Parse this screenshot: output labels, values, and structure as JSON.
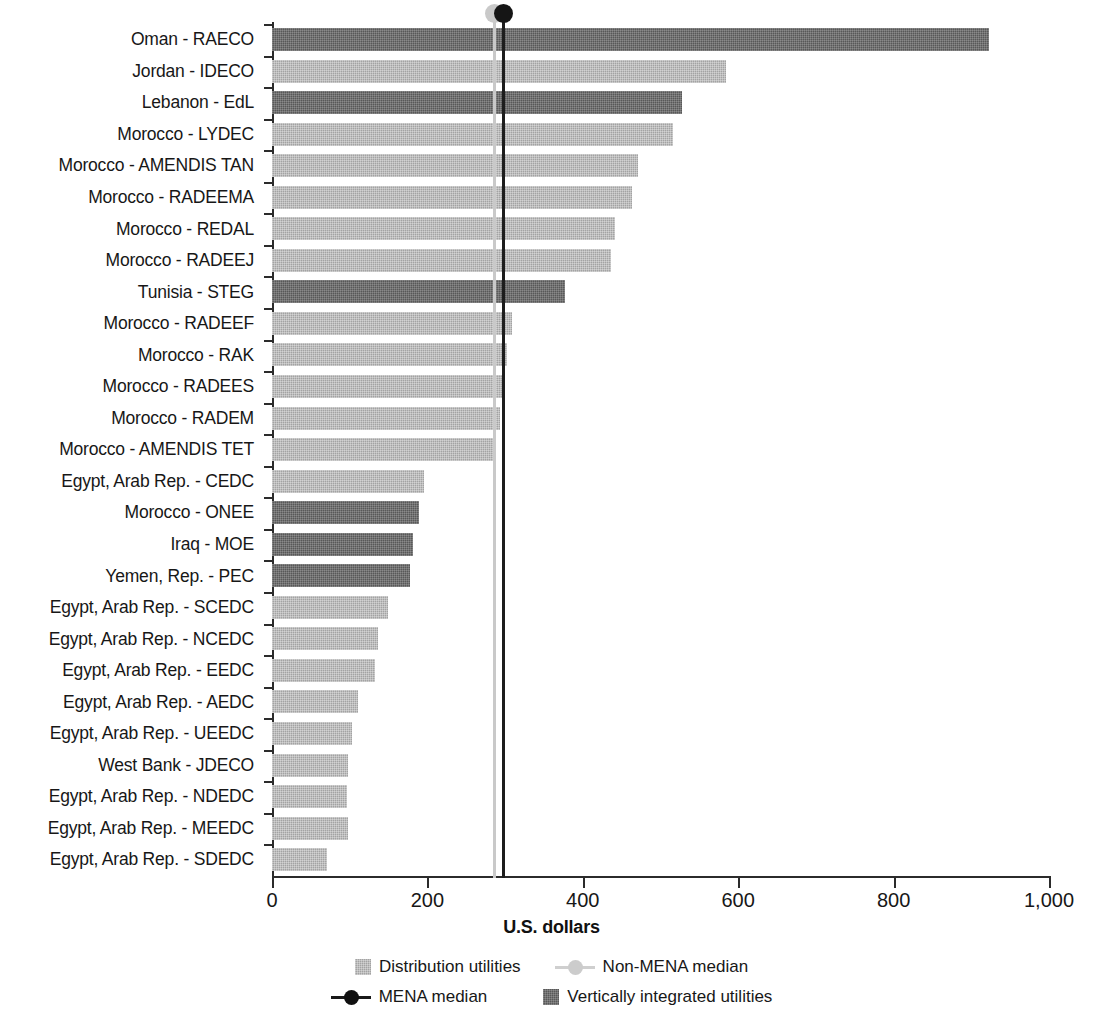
{
  "chart_data": {
    "type": "bar",
    "orientation": "horizontal",
    "title": "",
    "xlabel": "U.S. dollars",
    "ylabel": "",
    "xlim": [
      0,
      1000
    ],
    "xticks": [
      0,
      200,
      400,
      600,
      800,
      1000
    ],
    "xtick_labels": [
      "0",
      "200",
      "400",
      "600",
      "800",
      "1,000"
    ],
    "grid": false,
    "legend_position": "bottom",
    "categories": [
      "Oman - RAECO",
      "Jordan - IDECO",
      "Lebanon - EdL",
      "Morocco - LYDEC",
      "Morocco - AMENDIS TAN",
      "Morocco - RADEEMA",
      "Morocco - REDAL",
      "Morocco - RADEEJ",
      "Tunisia - STEG",
      "Morocco - RADEEF",
      "Morocco - RAK",
      "Morocco - RADEES",
      "Morocco - RADEM",
      "Morocco - AMENDIS TET",
      "Egypt, Arab Rep. - CEDC",
      "Morocco - ONEE",
      "Iraq - MOE",
      "Yemen, Rep. - PEC",
      "Egypt, Arab Rep. - SCEDC",
      "Egypt, Arab Rep. - NCEDC",
      "Egypt, Arab Rep. - EEDC",
      "Egypt, Arab Rep. - AEDC",
      "Egypt, Arab Rep. - UEEDC",
      "West Bank - JDECO",
      "Egypt, Arab Rep. - NDEDC",
      "Egypt, Arab Rep. - MEEDC",
      "Egypt, Arab Rep. - SDEDC"
    ],
    "values": [
      923,
      584,
      528,
      516,
      471,
      463,
      441,
      436,
      377,
      309,
      302,
      299,
      293,
      284,
      196,
      189,
      182,
      178,
      149,
      136,
      132,
      111,
      103,
      98,
      97,
      98,
      71
    ],
    "bar_types": [
      "vertically_integrated",
      "distribution",
      "vertically_integrated",
      "distribution",
      "distribution",
      "distribution",
      "distribution",
      "distribution",
      "vertically_integrated",
      "distribution",
      "distribution",
      "distribution",
      "distribution",
      "distribution",
      "distribution",
      "vertically_integrated",
      "vertically_integrated",
      "vertically_integrated",
      "distribution",
      "distribution",
      "distribution",
      "distribution",
      "distribution",
      "distribution",
      "distribution",
      "distribution",
      "distribution"
    ],
    "reference_lines": [
      {
        "name": "Non-MENA median",
        "value": 284,
        "style": "light"
      },
      {
        "name": "MENA median",
        "value": 296,
        "style": "dark"
      }
    ],
    "series": [
      {
        "name": "Distribution utilities",
        "color": "#a3a3a3"
      },
      {
        "name": "Vertically integrated utilities",
        "color": "#585858"
      }
    ]
  },
  "legend": {
    "items": [
      {
        "label": "Distribution utilities",
        "kind": "swatch",
        "variant": "dist"
      },
      {
        "label": "Non-MENA median",
        "kind": "marker",
        "variant": "nonmena"
      },
      {
        "label": "MENA median",
        "kind": "marker",
        "variant": "mena"
      },
      {
        "label": "Vertically integrated utilities",
        "kind": "swatch",
        "variant": "vert"
      }
    ]
  },
  "axis": {
    "x_title": "U.S. dollars"
  },
  "colors": {
    "distribution": "#a3a3a3",
    "vertically_integrated": "#585858",
    "mena_median": "#151515",
    "non_mena_median": "#c9c9c9",
    "axis": "#2b2b2b"
  }
}
